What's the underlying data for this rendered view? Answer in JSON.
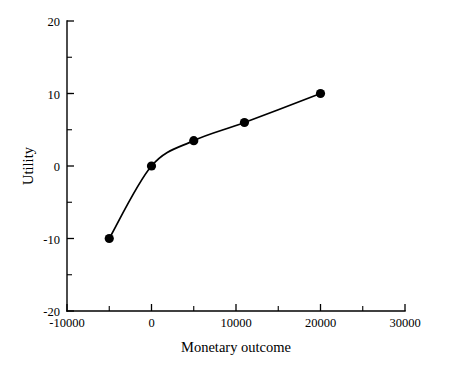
{
  "chart_data": {
    "type": "line",
    "title": "",
    "xlabel": "Monetary outcome",
    "ylabel": "Utility",
    "xlim": [
      -10000,
      30000
    ],
    "ylim": [
      -20,
      20
    ],
    "xticks": [
      -10000,
      0,
      10000,
      20000,
      30000
    ],
    "xtick_labels": [
      "-10000",
      "0",
      "10000",
      "20000",
      "30000"
    ],
    "yticks": [
      -20,
      -10,
      0,
      10,
      20
    ],
    "ytick_labels": [
      "-20",
      "-10",
      "0",
      "10",
      "20"
    ],
    "x_minor_tick_interval": 5000,
    "y_minor_tick_interval": 5,
    "grid": false,
    "legend": false,
    "series": [
      {
        "name": "Utility function",
        "marker": "filled-circle",
        "line_color": "#000000",
        "marker_color": "#000000",
        "x": [
          -5000,
          0,
          5000,
          11000,
          20000
        ],
        "y": [
          -10,
          0,
          3.5,
          6,
          10
        ],
        "points": [
          {
            "x": -5000,
            "y": -10
          },
          {
            "x": 0,
            "y": 0
          },
          {
            "x": 5000,
            "y": 3.5
          },
          {
            "x": 11000,
            "y": 6
          },
          {
            "x": 20000,
            "y": 10
          }
        ]
      }
    ]
  },
  "figure": {
    "background_color": "#ffffff",
    "foreground_color": "#000000"
  }
}
